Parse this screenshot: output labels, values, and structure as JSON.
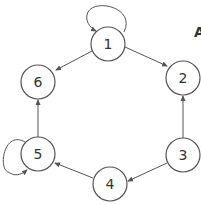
{
  "diagram": {
    "type": "directed-graph",
    "corner_label": "A",
    "nodes": [
      {
        "id": "1",
        "label": "1",
        "x": 108,
        "y": 44
      },
      {
        "id": "2",
        "label": "2",
        "x": 183,
        "y": 78
      },
      {
        "id": "3",
        "label": "3",
        "x": 183,
        "y": 155
      },
      {
        "id": "4",
        "label": "4",
        "x": 110,
        "y": 184
      },
      {
        "id": "5",
        "label": "5",
        "x": 38,
        "y": 154
      },
      {
        "id": "6",
        "label": "6",
        "x": 38,
        "y": 82
      }
    ],
    "edges": [
      {
        "from": "1",
        "to": "1",
        "self_loop": true
      },
      {
        "from": "1",
        "to": "6"
      },
      {
        "from": "1",
        "to": "2"
      },
      {
        "from": "3",
        "to": "2"
      },
      {
        "from": "3",
        "to": "4"
      },
      {
        "from": "4",
        "to": "5"
      },
      {
        "from": "5",
        "to": "6"
      },
      {
        "from": "5",
        "to": "5",
        "self_loop": true
      }
    ]
  }
}
